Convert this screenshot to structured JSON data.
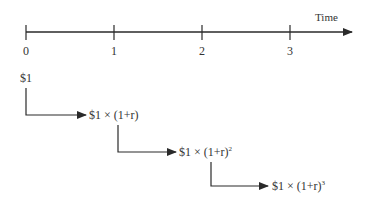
{
  "diagram": {
    "type": "timeline-compounding",
    "axis": {
      "label": "Time",
      "ticks": [
        "0",
        "1",
        "2",
        "3"
      ]
    },
    "steps": [
      {
        "period": "0",
        "label": "$1"
      },
      {
        "period": "1",
        "label_base": "$1 × (1+r)",
        "exponent": ""
      },
      {
        "period": "2",
        "label_base": "$1 × (1+r)",
        "exponent": "2"
      },
      {
        "period": "3",
        "label_base": "$1 × (1+r)",
        "exponent": "3"
      }
    ],
    "colors": {
      "line": "#2a2a2a",
      "text": "#333333",
      "background": "#ffffff"
    }
  }
}
